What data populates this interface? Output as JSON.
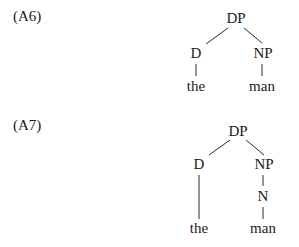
{
  "examples": [
    {
      "label": "(A6)",
      "nodes": {
        "root": "DP",
        "left": "D",
        "right": "NP",
        "left_leaf": "the",
        "right_leaf": "man"
      }
    },
    {
      "label": "(A7)",
      "nodes": {
        "root": "DP",
        "left": "D",
        "right": "NP",
        "right_mid": "N",
        "left_leaf": "the",
        "right_leaf": "man"
      }
    }
  ]
}
